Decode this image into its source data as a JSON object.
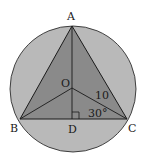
{
  "diagram": {
    "type": "geometry",
    "colors": {
      "circle_fill": "#b9b9b9",
      "triangle_fill": "#8a8a8a",
      "stroke": "#1a1a1a",
      "background": "#ffffff"
    },
    "points": {
      "A": {
        "label": "A",
        "x": 72,
        "y": 26
      },
      "B": {
        "label": "B",
        "x": 20,
        "y": 119
      },
      "C": {
        "label": "C",
        "x": 127,
        "y": 119
      },
      "O": {
        "label": "O",
        "x": 72,
        "y": 88
      },
      "D": {
        "label": "D",
        "x": 72,
        "y": 119
      }
    },
    "annotations": {
      "oc_length": "10",
      "angle_ocd": "30°"
    }
  }
}
